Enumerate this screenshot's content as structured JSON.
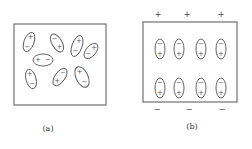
{
  "panels": [
    {
      "id": "a",
      "caption": "(a)",
      "frame": {
        "x": 14,
        "y": 24,
        "w": 92,
        "h": 81
      },
      "dipoles": [
        {
          "cx": 29,
          "cy": 42,
          "rx": 5,
          "ry": 10,
          "angle": 20,
          "top": "+",
          "bottom": "−"
        },
        {
          "cx": 57,
          "cy": 43,
          "rx": 5,
          "ry": 10,
          "angle": -30,
          "top": "−",
          "bottom": "+"
        },
        {
          "cx": 77,
          "cy": 46,
          "rx": 5,
          "ry": 11,
          "angle": 20,
          "top": "+",
          "bottom": "−"
        },
        {
          "cx": 91,
          "cy": 51,
          "rx": 5,
          "ry": 9,
          "angle": 40,
          "top": "+",
          "bottom": "−"
        },
        {
          "cx": 43,
          "cy": 60,
          "rx": 10,
          "ry": 6,
          "angle": 0,
          "top": "+",
          "bottom": "−",
          "horizontal": true
        },
        {
          "cx": 31,
          "cy": 79,
          "rx": 5,
          "ry": 10,
          "angle": -15,
          "top": "+",
          "bottom": "−"
        },
        {
          "cx": 60,
          "cy": 77,
          "rx": 5,
          "ry": 10,
          "angle": 35,
          "top": "−",
          "bottom": "+"
        },
        {
          "cx": 82,
          "cy": 77,
          "rx": 6,
          "ry": 11,
          "angle": -25,
          "top": "+",
          "bottom": "−"
        }
      ]
    },
    {
      "id": "b",
      "caption": "(b)",
      "frame": {
        "x": 143,
        "y": 22,
        "w": 94,
        "h": 80
      },
      "top_charges": [
        {
          "x": 158,
          "label": "+"
        },
        {
          "x": 187,
          "label": "+"
        },
        {
          "x": 221,
          "label": "+"
        }
      ],
      "bottom_charges": [
        {
          "x": 157,
          "label": "−"
        },
        {
          "x": 189,
          "label": "−"
        },
        {
          "x": 222,
          "label": "−"
        }
      ],
      "charge_rows_y": {
        "top": 14,
        "bottom": 109
      },
      "dipole_columns_x": [
        160,
        179,
        201,
        221
      ],
      "dipole_rows_y": [
        49,
        88
      ],
      "dipole": {
        "rx": 5,
        "ry": 10,
        "top": "−",
        "bottom": "+"
      }
    }
  ],
  "captions": {
    "a": "(a)",
    "b": "(b)"
  },
  "caption_positions": {
    "a": {
      "x": 48,
      "y": 128
    },
    "b": {
      "x": 192,
      "y": 126
    }
  }
}
